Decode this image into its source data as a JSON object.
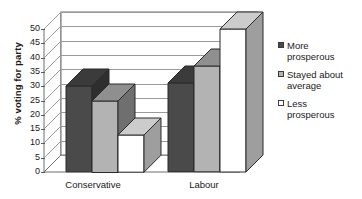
{
  "chart_data": {
    "type": "bar",
    "title": "",
    "subtitle": "",
    "xlabel": "",
    "ylabel": "% voting for party",
    "categories": [
      "Conservative",
      "Labour"
    ],
    "series": [
      {
        "name": "More prosperous",
        "values": [
          30,
          31
        ],
        "color": "#4a4a4a"
      },
      {
        "name": "Stayed about average",
        "values": [
          25,
          37
        ],
        "color": "#b3b3b3"
      },
      {
        "name": "Less prosperous",
        "values": [
          13,
          50
        ],
        "color": "#ffffff"
      }
    ],
    "ylim": [
      0,
      50
    ],
    "ytick_step": 5,
    "yticks": [
      0,
      5,
      10,
      15,
      20,
      25,
      30,
      35,
      40,
      45,
      50
    ],
    "ytick_labels": [
      "0",
      "5",
      "10",
      "15",
      "20",
      "25",
      "30",
      "35",
      "40",
      "45",
      "50"
    ],
    "grid": true,
    "legend_position": "right",
    "style": "3d-bar-grayscale"
  },
  "axis": {
    "y_title": "% voting for party",
    "ticks": [
      "50",
      "45",
      "40",
      "35",
      "30",
      "25",
      "20",
      "15",
      "10",
      "5",
      "0"
    ],
    "categories": [
      "Conservative",
      "Labour"
    ]
  },
  "legend": {
    "items": [
      {
        "label_line1": "More",
        "label_line2": "prosperous",
        "swatch": "#4a4a4a"
      },
      {
        "label_line1": "Stayed about",
        "label_line2": "average",
        "swatch": "#b3b3b3"
      },
      {
        "label_line1": "Less",
        "label_line2": "prosperous",
        "swatch": "#ffffff"
      }
    ]
  }
}
